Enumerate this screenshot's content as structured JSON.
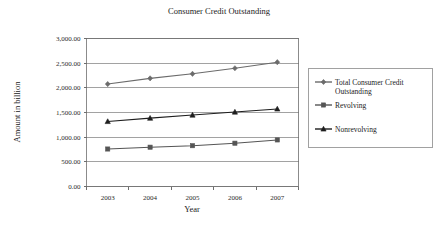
{
  "chart_data": {
    "type": "line",
    "title": "Consumer Credit Outstanding",
    "xlabel": "Year",
    "ylabel": "Amount in billion",
    "categories": [
      "2003",
      "2004",
      "2005",
      "2006",
      "2007"
    ],
    "ylim": [
      0,
      3000
    ],
    "ytick_values": [
      0,
      500,
      1000,
      1500,
      2000,
      2500,
      3000
    ],
    "ytick_labels": [
      "0.00",
      "500.00",
      "1,000.00",
      "1,500.00",
      "2,000.00",
      "2,500.00",
      "3,000.00"
    ],
    "grid": true,
    "legend_position": "right",
    "series": [
      {
        "name": "Total Consumer Credit Outstanding",
        "marker": "diamond",
        "color": "#6b6b6b",
        "values": [
          2077,
          2192,
          2284,
          2397,
          2520
        ]
      },
      {
        "name": "Revolving",
        "marker": "square",
        "color": "#555555",
        "values": [
          760,
          797,
          827,
          878,
          944
        ]
      },
      {
        "name": "Nonrevolving",
        "marker": "triangle",
        "color": "#1e1e1e",
        "values": [
          1318,
          1385,
          1448,
          1509,
          1572
        ]
      }
    ]
  },
  "legend": {
    "entries": [
      {
        "label_line1": "Total Consumer Credit",
        "label_line2": "Outstanding"
      },
      {
        "label_line1": "Revolving",
        "label_line2": ""
      },
      {
        "label_line1": "Nonrevolving",
        "label_line2": ""
      }
    ]
  }
}
